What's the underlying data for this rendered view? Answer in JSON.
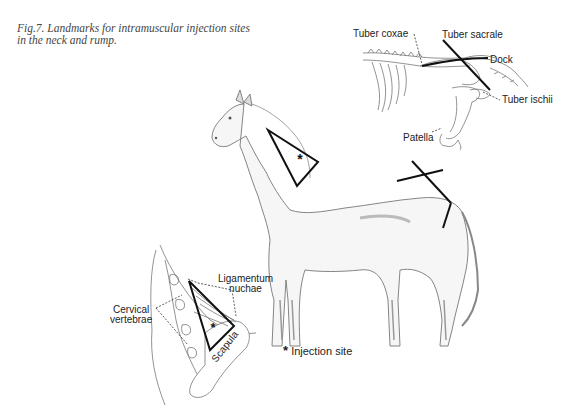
{
  "figure": {
    "caption_line1": "Fig.7. Landmarks for intramuscular injection sites",
    "caption_line2": "in the neck and rump."
  },
  "pelvis_inset": {
    "labels": {
      "tuber_coxae": "Tuber coxae",
      "tuber_sacrale": "Tuber sacrale",
      "dock": "Dock",
      "tuber_ischii": "Tuber ischii",
      "patella": "Patella"
    }
  },
  "neck_inset": {
    "labels": {
      "ligamentum_line1": "Ligamentum",
      "ligamentum_line2": "nuchae",
      "cervical_line1": "Cervical",
      "cervical_line2": "vertebrae",
      "scapula": "Scapula"
    }
  },
  "legend": {
    "symbol": "*",
    "text": "Injection site"
  }
}
